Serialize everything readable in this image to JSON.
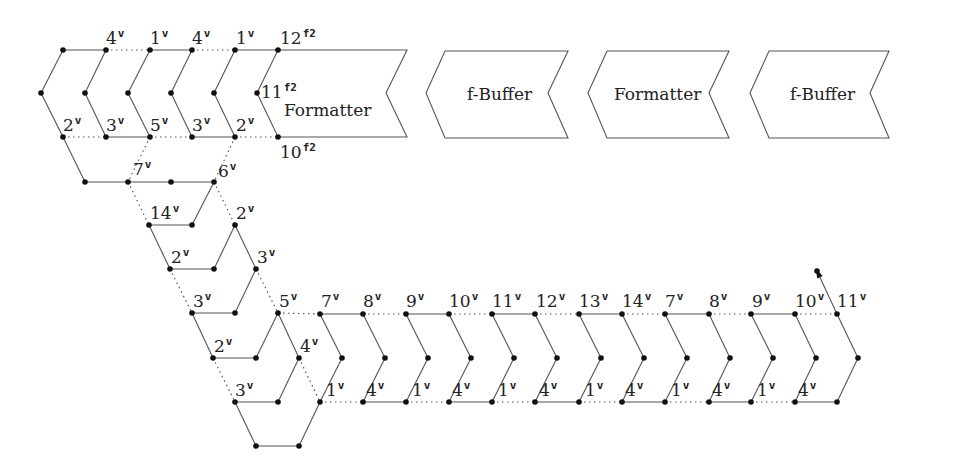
{
  "diagram": {
    "stages": [
      {
        "id": "formatter-1",
        "label": "Formatter",
        "points": [
          [
            278,
            50
          ],
          [
            407,
            50
          ],
          [
            386,
            93
          ],
          [
            407,
            137
          ],
          [
            278,
            137
          ],
          [
            257,
            93
          ]
        ],
        "text_xy": [
          284,
          116
        ]
      },
      {
        "id": "f-buffer-1",
        "label": "f-Buffer",
        "points": [
          [
            445,
            51
          ],
          [
            568,
            51
          ],
          [
            548,
            93
          ],
          [
            568,
            138
          ],
          [
            445,
            138
          ],
          [
            426,
            93
          ]
        ],
        "text_xy": [
          467,
          100
        ]
      },
      {
        "id": "formatter-2",
        "label": "Formatter",
        "points": [
          [
            607,
            51
          ],
          [
            729,
            51
          ],
          [
            709,
            93
          ],
          [
            729,
            138
          ],
          [
            607,
            138
          ],
          [
            588,
            93
          ]
        ],
        "text_xy": [
          614,
          100
        ]
      },
      {
        "id": "f-buffer-2",
        "label": "f-Buffer",
        "points": [
          [
            769,
            51
          ],
          [
            889,
            51
          ],
          [
            870,
            93
          ],
          [
            889,
            138
          ],
          [
            769,
            138
          ],
          [
            750,
            93
          ]
        ],
        "text_xy": [
          790,
          100
        ]
      }
    ],
    "nodes": [
      [
        63,
        50
      ],
      [
        106,
        50
      ],
      [
        150,
        50
      ],
      [
        192,
        50
      ],
      [
        235,
        50
      ],
      [
        278,
        50
      ],
      [
        41,
        93
      ],
      [
        85,
        93
      ],
      [
        128,
        93
      ],
      [
        171,
        93
      ],
      [
        214,
        93
      ],
      [
        257,
        93
      ],
      [
        63,
        137
      ],
      [
        106,
        137
      ],
      [
        150,
        137
      ],
      [
        192,
        137
      ],
      [
        235,
        137
      ],
      [
        278,
        137
      ],
      [
        85,
        182
      ],
      [
        128,
        182
      ],
      [
        171,
        182
      ],
      [
        214,
        182
      ],
      [
        149,
        225
      ],
      [
        192,
        225
      ],
      [
        235,
        225
      ],
      [
        170,
        269
      ],
      [
        214,
        269
      ],
      [
        256,
        269
      ],
      [
        192,
        313
      ],
      [
        235,
        313
      ],
      [
        278,
        313
      ],
      [
        213,
        358
      ],
      [
        256,
        358
      ],
      [
        299,
        358
      ],
      [
        235,
        402
      ],
      [
        278,
        402
      ],
      [
        256,
        446
      ],
      [
        299,
        446
      ],
      [
        320,
        314
      ],
      [
        363,
        314
      ],
      [
        406,
        314
      ],
      [
        449,
        314
      ],
      [
        492,
        314
      ],
      [
        535,
        314
      ],
      [
        579,
        314
      ],
      [
        622,
        314
      ],
      [
        665,
        314
      ],
      [
        709,
        314
      ],
      [
        751,
        314
      ],
      [
        795,
        314
      ],
      [
        837,
        314
      ],
      [
        342,
        358
      ],
      [
        385,
        358
      ],
      [
        428,
        358
      ],
      [
        471,
        358
      ],
      [
        514,
        358
      ],
      [
        557,
        358
      ],
      [
        601,
        358
      ],
      [
        644,
        358
      ],
      [
        687,
        358
      ],
      [
        730,
        358
      ],
      [
        773,
        358
      ],
      [
        816,
        358
      ],
      [
        858,
        358
      ],
      [
        320,
        402
      ],
      [
        363,
        402
      ],
      [
        406,
        402
      ],
      [
        449,
        402
      ],
      [
        492,
        402
      ],
      [
        535,
        402
      ],
      [
        579,
        402
      ],
      [
        622,
        402
      ],
      [
        665,
        402
      ],
      [
        709,
        402
      ],
      [
        751,
        402
      ],
      [
        795,
        402
      ],
      [
        837,
        402
      ],
      [
        817,
        271
      ]
    ],
    "solid_edges": [
      [
        63,
        50,
        106,
        50
      ],
      [
        150,
        50,
        192,
        50
      ],
      [
        235,
        50,
        278,
        50
      ],
      [
        63,
        50,
        41,
        93
      ],
      [
        106,
        50,
        85,
        93
      ],
      [
        150,
        50,
        128,
        93
      ],
      [
        192,
        50,
        171,
        93
      ],
      [
        235,
        50,
        214,
        93
      ],
      [
        41,
        93,
        63,
        137
      ],
      [
        85,
        93,
        106,
        137
      ],
      [
        128,
        93,
        150,
        137
      ],
      [
        171,
        93,
        192,
        137
      ],
      [
        214,
        93,
        235,
        137
      ],
      [
        106,
        137,
        150,
        137
      ],
      [
        192,
        137,
        235,
        137
      ],
      [
        63,
        137,
        85,
        182
      ],
      [
        85,
        182,
        214,
        182
      ],
      [
        149,
        225,
        192,
        225
      ],
      [
        192,
        225,
        214,
        182
      ],
      [
        149,
        225,
        170,
        269
      ],
      [
        170,
        269,
        214,
        269
      ],
      [
        214,
        269,
        235,
        225
      ],
      [
        235,
        225,
        256,
        269
      ],
      [
        192,
        313,
        235,
        313
      ],
      [
        235,
        313,
        256,
        269
      ],
      [
        192,
        313,
        213,
        358
      ],
      [
        213,
        358,
        256,
        358
      ],
      [
        256,
        358,
        278,
        313
      ],
      [
        278,
        313,
        299,
        358
      ],
      [
        235,
        402,
        278,
        402
      ],
      [
        278,
        402,
        299,
        358
      ],
      [
        235,
        402,
        256,
        446
      ],
      [
        256,
        446,
        299,
        446
      ],
      [
        299,
        446,
        320,
        402
      ],
      [
        320,
        314,
        363,
        314
      ],
      [
        406,
        314,
        449,
        314
      ],
      [
        492,
        314,
        535,
        314
      ],
      [
        579,
        314,
        622,
        314
      ],
      [
        665,
        314,
        709,
        314
      ],
      [
        751,
        314,
        795,
        314
      ],
      [
        363,
        402,
        406,
        402
      ],
      [
        449,
        402,
        492,
        402
      ],
      [
        535,
        402,
        579,
        402
      ],
      [
        622,
        402,
        665,
        402
      ],
      [
        709,
        402,
        751,
        402
      ],
      [
        795,
        402,
        837,
        402
      ],
      [
        320,
        314,
        342,
        358
      ],
      [
        342,
        358,
        320,
        402
      ],
      [
        363,
        314,
        385,
        358
      ],
      [
        385,
        358,
        363,
        402
      ],
      [
        406,
        314,
        428,
        358
      ],
      [
        428,
        358,
        406,
        402
      ],
      [
        449,
        314,
        471,
        358
      ],
      [
        471,
        358,
        449,
        402
      ],
      [
        492,
        314,
        514,
        358
      ],
      [
        514,
        358,
        492,
        402
      ],
      [
        535,
        314,
        557,
        358
      ],
      [
        557,
        358,
        535,
        402
      ],
      [
        579,
        314,
        601,
        358
      ],
      [
        601,
        358,
        579,
        402
      ],
      [
        622,
        314,
        644,
        358
      ],
      [
        644,
        358,
        622,
        402
      ],
      [
        665,
        314,
        687,
        358
      ],
      [
        687,
        358,
        665,
        402
      ],
      [
        709,
        314,
        730,
        358
      ],
      [
        730,
        358,
        709,
        402
      ],
      [
        751,
        314,
        773,
        358
      ],
      [
        773,
        358,
        751,
        402
      ],
      [
        795,
        314,
        816,
        358
      ],
      [
        816,
        358,
        795,
        402
      ],
      [
        837,
        314,
        858,
        358
      ],
      [
        858,
        358,
        837,
        402
      ],
      [
        837,
        314,
        817,
        271
      ]
    ],
    "dotted_edges": [
      [
        106,
        50,
        150,
        50
      ],
      [
        192,
        50,
        235,
        50
      ],
      [
        63,
        137,
        106,
        137
      ],
      [
        150,
        137,
        192,
        137
      ],
      [
        235,
        137,
        278,
        137
      ],
      [
        150,
        137,
        128,
        182
      ],
      [
        235,
        137,
        214,
        182
      ],
      [
        128,
        182,
        149,
        225
      ],
      [
        214,
        182,
        235,
        225
      ],
      [
        170,
        269,
        192,
        313
      ],
      [
        256,
        269,
        278,
        313
      ],
      [
        213,
        358,
        235,
        402
      ],
      [
        299,
        358,
        320,
        402
      ],
      [
        278,
        313,
        320,
        314
      ],
      [
        363,
        314,
        406,
        314
      ],
      [
        449,
        314,
        492,
        314
      ],
      [
        535,
        314,
        579,
        314
      ],
      [
        622,
        314,
        665,
        314
      ],
      [
        709,
        314,
        751,
        314
      ],
      [
        795,
        314,
        837,
        314
      ],
      [
        320,
        402,
        363,
        402
      ],
      [
        406,
        402,
        449,
        402
      ],
      [
        492,
        402,
        535,
        402
      ],
      [
        579,
        402,
        622,
        402
      ],
      [
        665,
        402,
        709,
        402
      ],
      [
        751,
        402,
        795,
        402
      ]
    ],
    "arrow": {
      "from": [
        837,
        314
      ],
      "to": [
        817,
        271
      ]
    },
    "labels": [
      {
        "text": "4",
        "sup": "v",
        "x": 106,
        "y": 44
      },
      {
        "text": "1",
        "sup": "v",
        "x": 150,
        "y": 44
      },
      {
        "text": "4",
        "sup": "v",
        "x": 192,
        "y": 44
      },
      {
        "text": "1",
        "sup": "v",
        "x": 236,
        "y": 44
      },
      {
        "text": "12",
        "sup": "f2",
        "x": 280,
        "y": 44
      },
      {
        "text": "11",
        "sup": "f2",
        "x": 261,
        "y": 98
      },
      {
        "text": "2",
        "sup": "v",
        "x": 63,
        "y": 131
      },
      {
        "text": "3",
        "sup": "v",
        "x": 106,
        "y": 131
      },
      {
        "text": "5",
        "sup": "v",
        "x": 150,
        "y": 131
      },
      {
        "text": "3",
        "sup": "v",
        "x": 192,
        "y": 131
      },
      {
        "text": "2",
        "sup": "v",
        "x": 236,
        "y": 131
      },
      {
        "text": "10",
        "sup": "f2",
        "x": 280,
        "y": 158
      },
      {
        "text": "7",
        "sup": "v",
        "x": 133,
        "y": 175
      },
      {
        "text": "6",
        "sup": "v",
        "x": 218,
        "y": 177
      },
      {
        "text": "14",
        "sup": "v",
        "x": 150,
        "y": 219
      },
      {
        "text": "2",
        "sup": "v",
        "x": 236,
        "y": 219
      },
      {
        "text": "2",
        "sup": "v",
        "x": 171,
        "y": 263
      },
      {
        "text": "3",
        "sup": "v",
        "x": 257,
        "y": 263
      },
      {
        "text": "3",
        "sup": "v",
        "x": 193,
        "y": 307
      },
      {
        "text": "5",
        "sup": "v",
        "x": 279,
        "y": 307
      },
      {
        "text": "2",
        "sup": "v",
        "x": 214,
        "y": 352
      },
      {
        "text": "4",
        "sup": "v",
        "x": 300,
        "y": 352
      },
      {
        "text": "3",
        "sup": "v",
        "x": 235,
        "y": 396
      },
      {
        "text": "7",
        "sup": "v",
        "x": 321,
        "y": 307
      },
      {
        "text": "8",
        "sup": "v",
        "x": 363,
        "y": 307
      },
      {
        "text": "9",
        "sup": "v",
        "x": 406,
        "y": 307
      },
      {
        "text": "10",
        "sup": "v",
        "x": 449,
        "y": 307
      },
      {
        "text": "11",
        "sup": "v",
        "x": 492,
        "y": 307
      },
      {
        "text": "12",
        "sup": "v",
        "x": 536,
        "y": 307
      },
      {
        "text": "13",
        "sup": "v",
        "x": 579,
        "y": 307
      },
      {
        "text": "14",
        "sup": "v",
        "x": 622,
        "y": 307
      },
      {
        "text": "7",
        "sup": "v",
        "x": 665,
        "y": 307
      },
      {
        "text": "8",
        "sup": "v",
        "x": 709,
        "y": 307
      },
      {
        "text": "9",
        "sup": "v",
        "x": 752,
        "y": 307
      },
      {
        "text": "10",
        "sup": "v",
        "x": 795,
        "y": 307
      },
      {
        "text": "11",
        "sup": "v",
        "x": 837,
        "y": 307
      },
      {
        "text": "1",
        "sup": "v",
        "x": 326,
        "y": 396
      },
      {
        "text": "4",
        "sup": "v",
        "x": 366,
        "y": 396
      },
      {
        "text": "1",
        "sup": "v",
        "x": 412,
        "y": 396
      },
      {
        "text": "4",
        "sup": "v",
        "x": 452,
        "y": 396
      },
      {
        "text": "1",
        "sup": "v",
        "x": 498,
        "y": 396
      },
      {
        "text": "4",
        "sup": "v",
        "x": 539,
        "y": 396
      },
      {
        "text": "1",
        "sup": "v",
        "x": 585,
        "y": 396
      },
      {
        "text": "4",
        "sup": "v",
        "x": 625,
        "y": 396
      },
      {
        "text": "1",
        "sup": "v",
        "x": 671,
        "y": 396
      },
      {
        "text": "4",
        "sup": "v",
        "x": 712,
        "y": 396
      },
      {
        "text": "1",
        "sup": "v",
        "x": 757,
        "y": 396
      },
      {
        "text": "4",
        "sup": "v",
        "x": 798,
        "y": 396
      }
    ],
    "colors": {
      "stroke": "#555555",
      "node": "#111111",
      "text": "#222222",
      "background": "#ffffff"
    }
  }
}
